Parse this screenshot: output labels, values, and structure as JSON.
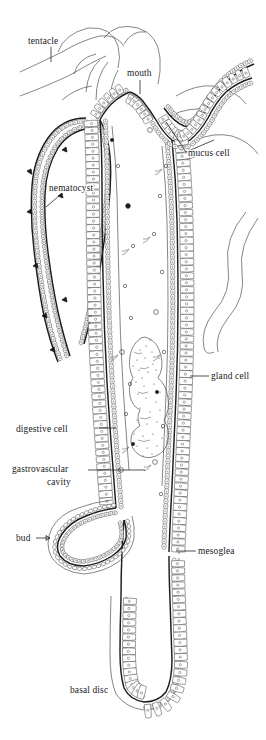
{
  "figure": {
    "organism": "Hydra",
    "view": "longitudinal section through body column, tentacles, bud and basal disc",
    "background_color": "#ffffff",
    "ink_color": "#1a1a1a",
    "width": 266,
    "height": 740
  },
  "labels": [
    {
      "id": "tentacle",
      "text": "tentacle",
      "x": 28,
      "y": 44,
      "anchor": "start",
      "leader": "vertical tick below text pointing to tentacle outline"
    },
    {
      "id": "mouth",
      "text": "mouth",
      "x": 127,
      "y": 76,
      "anchor": "start",
      "leader": "short vertical tick down to hypostome opening"
    },
    {
      "id": "mucus-cell",
      "text": "mucus cell",
      "x": 188,
      "y": 156,
      "anchor": "start",
      "leader": "diagonal line up-left to ectoderm of hypostome"
    },
    {
      "id": "nematocyst",
      "text": "nematocyst",
      "x": 49,
      "y": 191,
      "anchor": "start",
      "leader": "short diagonal line down-left to stinging cell in tentacle ectoderm"
    },
    {
      "id": "gland-cell",
      "text": "gland cell",
      "x": 211,
      "y": 379,
      "anchor": "start",
      "leader": "horizontal line left to endoderm gland cell"
    },
    {
      "id": "digestive-cell",
      "text": "digestive cell",
      "x": 16,
      "y": 432,
      "anchor": "start",
      "leader": "horizontal line right to endodermal digestive cell"
    },
    {
      "id": "gastrovascular-cavity",
      "text": "gastrovascular",
      "text_line2": "cavity",
      "x": 12,
      "y": 472,
      "anchor": "start",
      "leader": "horizontal line right into the central cavity"
    },
    {
      "id": "bud",
      "text": "bud",
      "x": 16,
      "y": 541,
      "anchor": "start",
      "leader": "short arrow right to developing bud"
    },
    {
      "id": "mesoglea",
      "text": "mesoglea",
      "x": 198,
      "y": 554,
      "anchor": "start",
      "leader": "horizontal line left to the mesoglea layer"
    },
    {
      "id": "basal-disc",
      "text": "basal disc",
      "x": 70,
      "y": 693,
      "anchor": "start",
      "leader": "none"
    }
  ],
  "structures": [
    {
      "id": "tentacle-crown",
      "name": "tentacle crown",
      "note": "several tentacles arching from the hypostome at the top"
    },
    {
      "id": "hypostome",
      "name": "hypostome",
      "note": "conical mouth cone bearing the mouth opening"
    },
    {
      "id": "body-column",
      "name": "body column",
      "note": "long tubular trunk lined by ectoderm and endoderm"
    },
    {
      "id": "food-mass",
      "name": "ingested food mass",
      "note": "stippled prey mass inside the gastrovascular cavity"
    },
    {
      "id": "bud-outgrowth",
      "name": "bud",
      "note": "lateral outgrowth reproducing asexually"
    },
    {
      "id": "pedal-disc",
      "name": "basal disc",
      "note": "flattened adhesive foot at the base"
    }
  ],
  "layers": [
    {
      "id": "ectoderm",
      "name": "ectoderm",
      "note": "outer epithelium of columnar and cuboidal cells"
    },
    {
      "id": "mesoglea",
      "name": "mesoglea",
      "note": "thin acellular layer between the two epithelia"
    },
    {
      "id": "endoderm",
      "name": "endoderm",
      "note": "inner epithelium of digestive and gland cells"
    }
  ]
}
